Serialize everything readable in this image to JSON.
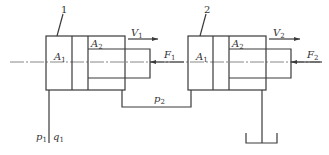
{
  "diagram": {
    "cylinders": [
      {
        "id": "1",
        "area_piston": "A",
        "area_piston_sub": "1",
        "area_annulus": "A",
        "area_annulus_sub": "2",
        "velocity": "V",
        "velocity_sub": "1",
        "load": "F",
        "load_sub": "1"
      },
      {
        "id": "2",
        "area_piston": "A",
        "area_piston_sub": "1",
        "area_annulus": "A",
        "area_annulus_sub": "2",
        "velocity": "V",
        "velocity_sub": "2",
        "load": "F",
        "load_sub": "2"
      }
    ],
    "supply": {
      "pressure": "p",
      "pressure_sub": "1",
      "flow": "q",
      "flow_sub": "1"
    },
    "intermediate": {
      "pressure": "p",
      "pressure_sub": "2"
    }
  }
}
